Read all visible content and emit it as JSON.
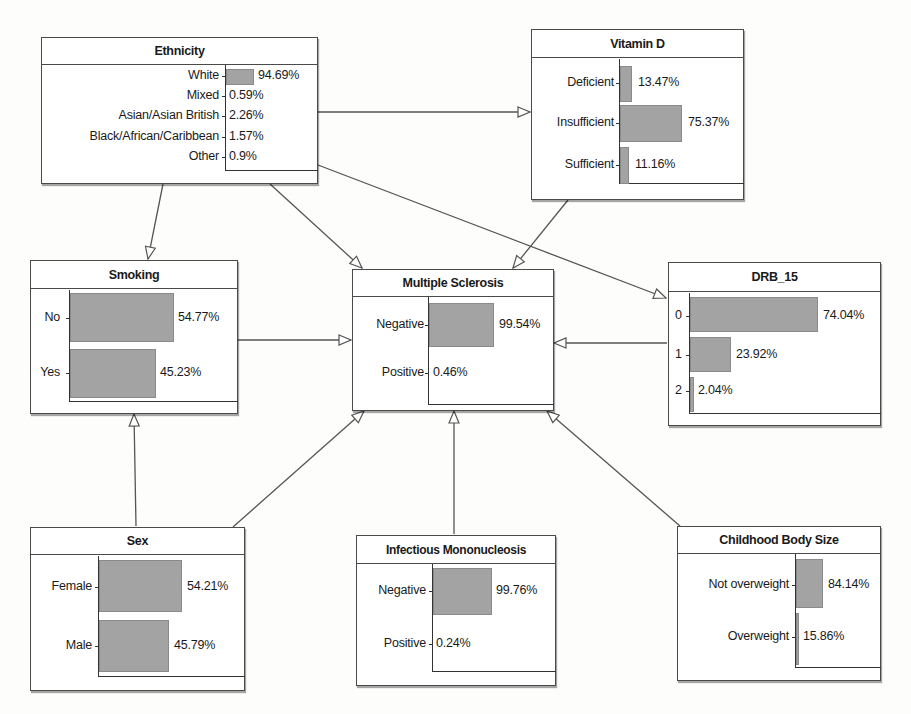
{
  "diagram": {
    "type": "bayesian-network",
    "bar_color": "#a3a3a3",
    "nodes": {
      "ethnicity": {
        "title": "Ethnicity",
        "states": [
          {
            "label": "White",
            "value": 94.69,
            "display": "94.69%"
          },
          {
            "label": "Mixed",
            "value": 0.59,
            "display": "0.59%"
          },
          {
            "label": "Asian/Asian British",
            "value": 2.26,
            "display": "2.26%"
          },
          {
            "label": "Black/African/Caribbean",
            "value": 1.57,
            "display": "1.57%"
          },
          {
            "label": "Other",
            "value": 0.9,
            "display": "0.9%"
          }
        ]
      },
      "vitamin_d": {
        "title": "Vitamin D",
        "states": [
          {
            "label": "Deficient",
            "value": 13.47,
            "display": "13.47%"
          },
          {
            "label": "Insufficient",
            "value": 75.37,
            "display": "75.37%"
          },
          {
            "label": "Sufficient",
            "value": 11.16,
            "display": "11.16%"
          }
        ]
      },
      "smoking": {
        "title": "Smoking",
        "states": [
          {
            "label": "No",
            "value": 54.77,
            "display": "54.77%"
          },
          {
            "label": "Yes",
            "value": 45.23,
            "display": "45.23%"
          }
        ]
      },
      "multiple_sclerosis": {
        "title": "Multiple Sclerosis",
        "states": [
          {
            "label": "Negative",
            "value": 99.54,
            "display": "99.54%"
          },
          {
            "label": "Positive",
            "value": 0.46,
            "display": "0.46%"
          }
        ]
      },
      "drb_15": {
        "title": "DRB_15",
        "states": [
          {
            "label": "0",
            "value": 74.04,
            "display": "74.04%"
          },
          {
            "label": "1",
            "value": 23.92,
            "display": "23.92%"
          },
          {
            "label": "2",
            "value": 2.04,
            "display": "2.04%"
          }
        ]
      },
      "sex": {
        "title": "Sex",
        "states": [
          {
            "label": "Female",
            "value": 54.21,
            "display": "54.21%"
          },
          {
            "label": "Male",
            "value": 45.79,
            "display": "45.79%"
          }
        ]
      },
      "infectious_mononucleosis": {
        "title": "Infectious Mononucleosis",
        "states": [
          {
            "label": "Negative",
            "value": 99.76,
            "display": "99.76%"
          },
          {
            "label": "Positive",
            "value": 0.24,
            "display": "0.24%"
          }
        ]
      },
      "childhood_body_size": {
        "title": "Childhood Body Size",
        "states": [
          {
            "label": "Not overweight",
            "value": 84.14,
            "display": "84.14%"
          },
          {
            "label": "Overweight",
            "value": 15.86,
            "display": "15.86%"
          }
        ]
      }
    },
    "edges": [
      {
        "from": "Ethnicity",
        "to": "Vitamin D"
      },
      {
        "from": "Ethnicity",
        "to": "Smoking"
      },
      {
        "from": "Ethnicity",
        "to": "Multiple Sclerosis"
      },
      {
        "from": "Ethnicity",
        "to": "DRB_15"
      },
      {
        "from": "Vitamin D",
        "to": "Multiple Sclerosis"
      },
      {
        "from": "Smoking",
        "to": "Multiple Sclerosis"
      },
      {
        "from": "DRB_15",
        "to": "Multiple Sclerosis"
      },
      {
        "from": "Sex",
        "to": "Smoking"
      },
      {
        "from": "Sex",
        "to": "Multiple Sclerosis"
      },
      {
        "from": "Infectious Mononucleosis",
        "to": "Multiple Sclerosis"
      },
      {
        "from": "Childhood Body Size",
        "to": "Multiple Sclerosis"
      }
    ]
  }
}
